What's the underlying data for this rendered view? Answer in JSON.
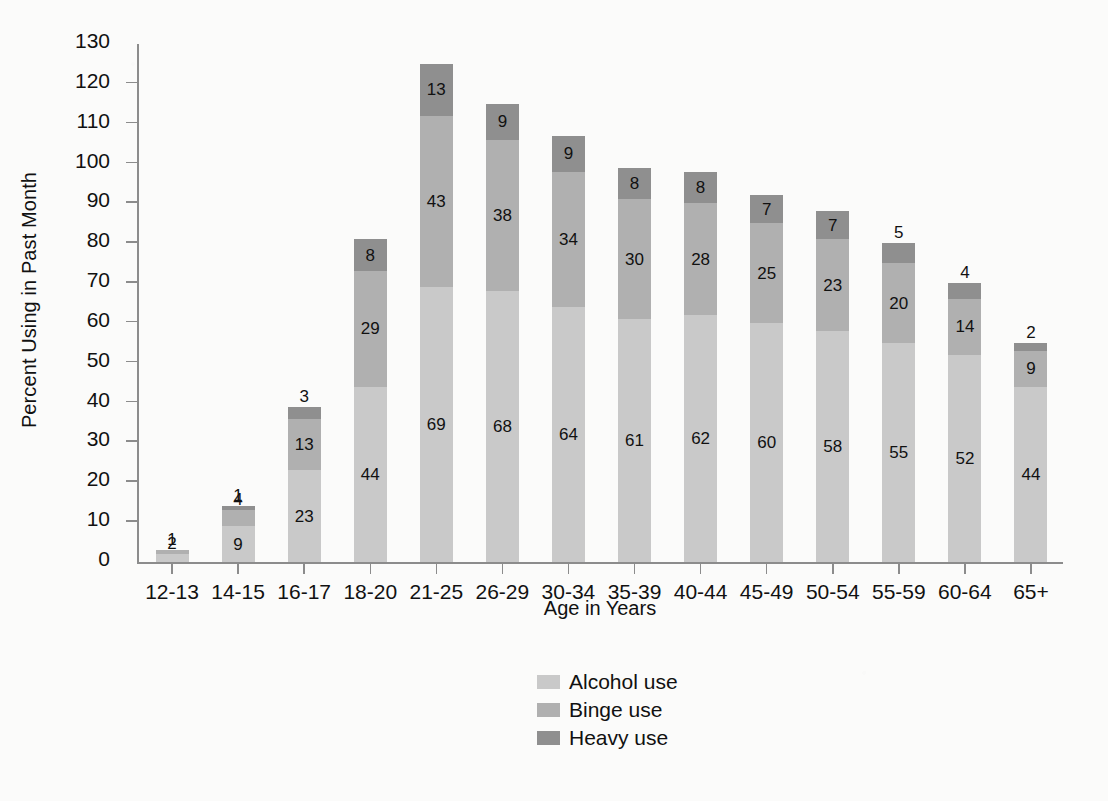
{
  "chart_data": {
    "type": "bar",
    "subtype": "stacked-bar",
    "title": "",
    "xlabel": "Age in Years",
    "ylabel": "Percent Using in Past Month",
    "ylim": [
      0,
      130
    ],
    "ytick_step": 10,
    "yticks": [
      0,
      10,
      20,
      30,
      40,
      50,
      60,
      70,
      80,
      90,
      100,
      110,
      120,
      130
    ],
    "grid": false,
    "legend_position": "bottom-center",
    "stacked": true,
    "categories": [
      "12-13",
      "14-15",
      "16-17",
      "18-20",
      "21-25",
      "26-29",
      "30-34",
      "35-39",
      "40-44",
      "45-49",
      "50-54",
      "55-59",
      "60-64",
      "65+"
    ],
    "series": [
      {
        "name": "Alcohol use",
        "color": "#c9c9c9",
        "values": [
          2,
          9,
          23,
          44,
          69,
          68,
          64,
          61,
          62,
          60,
          58,
          55,
          52,
          44
        ]
      },
      {
        "name": "Binge use",
        "color": "#b0b0b0",
        "values": [
          1,
          4,
          13,
          29,
          43,
          38,
          34,
          30,
          28,
          25,
          23,
          20,
          14,
          9
        ]
      },
      {
        "name": "Heavy use",
        "color": "#8f8f8f",
        "values": [
          0,
          1,
          3,
          8,
          13,
          9,
          9,
          8,
          8,
          7,
          7,
          5,
          4,
          2
        ]
      }
    ],
    "totals": [
      3,
      14,
      39,
      81,
      125,
      115,
      107,
      99,
      98,
      92,
      88,
      80,
      70,
      55
    ],
    "label_overrides": {
      "12-13": {
        "Binge use": "1",
        "Heavy use": ""
      }
    }
  },
  "legend": {
    "items": [
      {
        "label": "Alcohol use",
        "color": "#c9c9c9"
      },
      {
        "label": "Binge use",
        "color": "#b0b0b0"
      },
      {
        "label": "Heavy use",
        "color": "#8f8f8f"
      }
    ]
  },
  "colors": {
    "background": "#fbfbfa",
    "axis": "#8c8c8c",
    "text": "#111111",
    "alcohol": "#c9c9c9",
    "binge": "#b0b0b0",
    "heavy": "#8f8f8f"
  }
}
